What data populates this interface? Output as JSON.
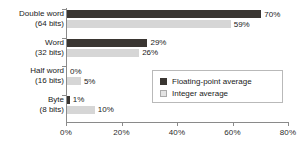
{
  "chart_data": {
    "type": "bar",
    "orientation": "horizontal",
    "title": "",
    "xlabel": "",
    "ylabel": "",
    "xlim": [
      0,
      80
    ],
    "xtick_labels": [
      "0%",
      "20%",
      "40%",
      "60%",
      "80%"
    ],
    "xticks": [
      0,
      20,
      40,
      60,
      80
    ],
    "grid": false,
    "legend_position": "bottom-right",
    "categories": [
      {
        "name": "Double word",
        "sub": "(64 bits)"
      },
      {
        "name": "Word",
        "sub": "(32 bits)"
      },
      {
        "name": "Half word",
        "sub": "(16 bits)"
      },
      {
        "name": "Byte",
        "sub": "(8 bits)"
      }
    ],
    "series": [
      {
        "name": "Floating-point average",
        "color": "#3a3632",
        "values": [
          70,
          29,
          0,
          1
        ],
        "labels": [
          "70%",
          "29%",
          "0%",
          "1%"
        ]
      },
      {
        "name": "Integer average",
        "color": "#d6d6d6",
        "values": [
          59,
          26,
          5,
          10
        ],
        "labels": [
          "59%",
          "26%",
          "5%",
          "10%"
        ]
      }
    ]
  },
  "legend": {
    "items": [
      {
        "label": "Floating-point average"
      },
      {
        "label": "Integer average"
      }
    ]
  }
}
